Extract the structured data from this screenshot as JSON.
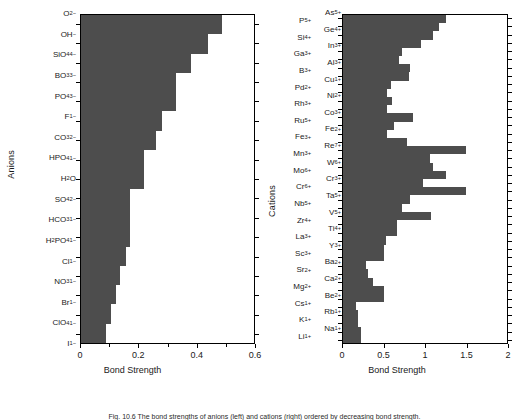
{
  "figure": {
    "caption": "Fig. 10.6  The bond strengths of anions (left) and cations (right) ordered by decreasing bond strength."
  },
  "chart_data": [
    {
      "type": "bar",
      "orientation": "horizontal",
      "title": "",
      "xlabel": "Bond Strength",
      "ylabel": "Anions",
      "xlim": [
        0,
        0.6
      ],
      "xticks": [
        0,
        0.2,
        0.4,
        0.6
      ],
      "xtick_labels": [
        "0",
        "0.2",
        "0.4",
        "0.6"
      ],
      "minor_xticks": [
        0.1,
        0.3,
        0.5
      ],
      "grid": false,
      "legend": "none",
      "bar_color": "#4d4d4d",
      "categories": [
        "O2-",
        "OH-",
        "SiO4 4-",
        "BO3 3-",
        "PO4 3-",
        "F1-",
        "CO3 2-",
        "HPO4 1-",
        "H2O",
        "SO4 2-",
        "HCO3 1-",
        "H2PO4 1-",
        "Cl1-",
        "NO3 1-",
        "Br1-",
        "ClO4 1-",
        "I1-"
      ],
      "category_labels": [
        "O<sup>2−</sup>",
        "OH<sup>−</sup>",
        "SiO<sub>4</sub><sup>4−</sup>",
        "BO<sub>3</sub><sup>3−</sup>",
        "PO<sub>4</sub><sup>3−</sup>",
        "F<sup>1−</sup>",
        "CO<sub>3</sub><sup>2−</sup>",
        "HPO<sub>4</sub><sup>1−</sup>",
        "H<sub>2</sub>O",
        "SO<sub>4</sub><sup>2−</sup>",
        "HCO<sub>3</sub><sup>1−</sup>",
        "H<sub>2</sub>PO<sub>4</sub><sup>1−</sup>",
        "Cl<sup>1−</sup>",
        "NO<sub>3</sub><sup>1−</sup>",
        "Br<sup>1−</sup>",
        "ClO<sub>4</sub><sup>1−</sup>",
        "I<sup>1−</sup>"
      ],
      "values": [
        0.49,
        0.44,
        0.38,
        0.33,
        0.33,
        0.28,
        0.26,
        0.22,
        0.22,
        0.17,
        0.17,
        0.17,
        0.155,
        0.135,
        0.12,
        0.105,
        0.085
      ]
    },
    {
      "type": "bar",
      "orientation": "horizontal",
      "title": "",
      "xlabel": "Bond Strength",
      "ylabel": "Cations",
      "xlim": [
        0,
        2
      ],
      "xticks": [
        0,
        0.5,
        1,
        1.5,
        2
      ],
      "xtick_labels": [
        "0",
        "0.5",
        "1",
        "1.5",
        "2"
      ],
      "grid": false,
      "legend": "none",
      "bar_color": "#4d4d4d",
      "categories": [
        "As5+",
        "P5+",
        "Ge4+",
        "Si4+",
        "In3+",
        "Ga3+",
        "Al3+",
        "B3+",
        "Cu1+",
        "Pd2+",
        "Ni2+",
        "Rh3+",
        "Co3+",
        "Ru5+",
        "Fe2+",
        "Fe3+",
        "Re7+",
        "Mn3+",
        "W6+",
        "Mo6+",
        "Cr3+",
        "Cr6+",
        "Ta5+",
        "Nb5+",
        "V5+",
        "Zr4+",
        "Ti4+",
        "La3+",
        "Y3+",
        "Sc3+",
        "Ba2+",
        "Sr2+",
        "Ca2+",
        "Mg2+",
        "Be2+",
        "Cs1+",
        "Rb1+",
        "K1+",
        "Na1+",
        "Li1+"
      ],
      "category_labels_outer": [
        "P<sup>5+</sup>",
        "Si<sup>4+</sup>",
        "Ga<sup>3+</sup>",
        "B<sup>3+</sup>",
        "Pd<sup>2+</sup>",
        "Rh<sup>3+</sup>",
        "Ru<sup>5+</sup>",
        "Fe<sup>3+</sup>",
        "Mn<sup>3+</sup>",
        "Mo<sup>6+</sup>",
        "Cr<sup>6+</sup>",
        "Nb<sup>5+</sup>",
        "Zr<sup>4+</sup>",
        "La<sup>3+</sup>",
        "Sc<sup>3+</sup>",
        "Sr<sup>2+</sup>",
        "Mg<sup>2+</sup>",
        "Cs<sup>1+</sup>",
        "K<sup>1+</sup>",
        "Li<sup>1+</sup>"
      ],
      "category_labels_inner": [
        "As<sup>5+</sup>",
        "Ge<sup>4+</sup>",
        "In<sup>3+</sup>",
        "Al<sup>3+</sup>",
        "Cu<sup>1+</sup>",
        "Ni<sup>2+</sup>",
        "Co<sup>3+</sup>",
        "Fe<sup>2+</sup>",
        "Re<sup>7+</sup>",
        "W<sup>6+</sup>",
        "Cr<sup>3+</sup>",
        "Ta<sup>5+</sup>",
        "V<sup>5+</sup>",
        "Ti<sup>4+</sup>",
        "Y<sup>3+</sup>",
        "Ba<sup>2+</sup>",
        "Ca<sup>2+</sup>",
        "Be<sup>2+</sup>",
        "Rb<sup>1+</sup>",
        "Na<sup>1+</sup>"
      ],
      "values": [
        1.25,
        1.17,
        1.1,
        0.95,
        0.72,
        0.68,
        0.82,
        0.8,
        0.58,
        0.54,
        0.6,
        0.54,
        0.85,
        0.62,
        0.54,
        0.78,
        1.5,
        1.06,
        1.1,
        1.25,
        0.98,
        1.5,
        0.82,
        0.72,
        1.07,
        0.66,
        0.66,
        0.52,
        0.5,
        0.5,
        0.28,
        0.3,
        0.36,
        0.5,
        0.5,
        0.16,
        0.18,
        0.18,
        0.22,
        0.22
      ]
    }
  ]
}
